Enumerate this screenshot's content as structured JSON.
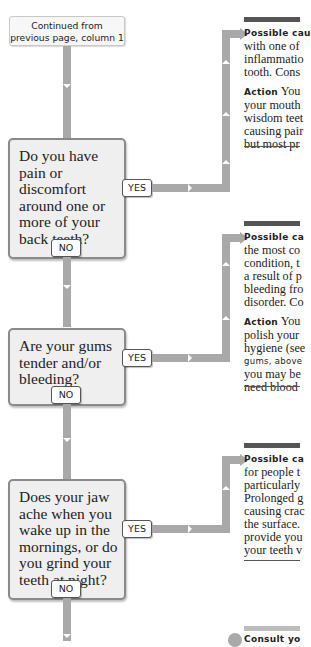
{
  "continued": {
    "line1": "Continued from",
    "line2": "previous page, column 1"
  },
  "questions": [
    {
      "lines": [
        "Do you have",
        "pain or",
        "discomfort",
        "around one or",
        "more of your",
        "back teeth?"
      ],
      "yes": "YES",
      "no": "NO"
    },
    {
      "lines": [
        "Are your gums",
        "tender and/or",
        "bleeding?"
      ],
      "yes": "YES",
      "no": "NO"
    },
    {
      "lines": [
        "Does your jaw",
        "ache when you",
        "wake up in the",
        "mornings, or do",
        "you grind your",
        "teeth at night?"
      ],
      "yes": "YES",
      "no": "NO"
    }
  ],
  "results": [
    {
      "cause_label": "Possible cau",
      "cause_lines": [
        "with one of",
        "inflammatio",
        "tooth. Cons"
      ],
      "action_label": "Action",
      "action_first": "You",
      "action_lines": [
        "your mouth",
        "wisdom teet",
        "causing pair",
        "but most pr"
      ]
    },
    {
      "cause_label": "Possible ca",
      "cause_lines": [
        "the most co",
        "condition, t",
        "a result of p",
        "bleeding fro",
        "disorder. Co"
      ],
      "action_label": "Action",
      "action_first": "You",
      "action_lines": [
        "polish your",
        "hygiene (see",
        "gums, above",
        "you may be",
        "need blood"
      ]
    },
    {
      "cause_label": "Possible ca",
      "cause_lines": [
        "for people t",
        "particularly",
        "Prolonged g",
        "causing crac",
        "the surface.",
        "provide you",
        "your teeth v"
      ]
    }
  ],
  "final": {
    "label": "Consult yo"
  },
  "colors": {
    "connector": "#a9a9a9",
    "box_fill": "#efefef",
    "box_border": "#8a8a8a",
    "rule": "#555555"
  }
}
